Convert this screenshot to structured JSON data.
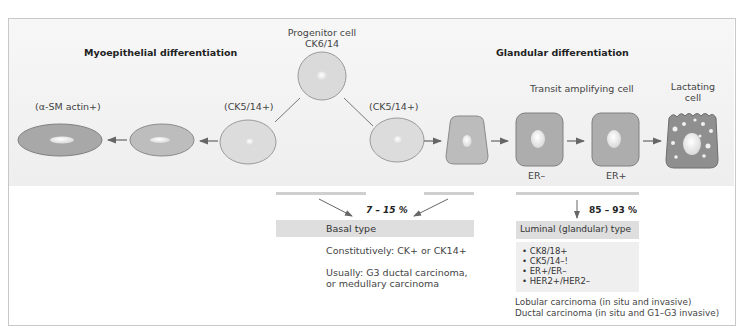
{
  "diagram": {
    "left_heading": "Myoepithelial differentiation",
    "right_heading": "Glandular differentiation",
    "progenitor": {
      "line1": "Progenitor cell",
      "line2": "CK6/14"
    },
    "left_cells": {
      "alpha_label": "(α-SM actin+)",
      "ck_label": "(CK5/14+)"
    },
    "right_cells": {
      "ck_label": "(CK5/14+)",
      "transit_label": "Transit amplifying cell",
      "er_minus": "ER–",
      "er_plus": "ER+",
      "lactating_line1": "Lactating",
      "lactating_line2": "cell"
    },
    "basal": {
      "percent": "7 – 15 %",
      "title": "Basal type",
      "line1": "Constitutively: CK+ or CK14+",
      "line2a": "Usually: G3 ductal carcinoma,",
      "line2b": "or medullary carcinoma"
    },
    "luminal": {
      "percent": "85 – 93 %",
      "title": "Luminal (glandular) type",
      "markers": [
        "• CK8/18+",
        "• CK5/14–!",
        "• ER+/ER–",
        "• HER2+/HER2–"
      ],
      "note1": "Lobular carcinoma (in situ and invasive)",
      "note2": "Ductal carcinoma (in situ and G1–G3 invasive)"
    },
    "colors": {
      "panel": "#eeeeee",
      "light_cell": "#dcdcdc",
      "mid_cell": "#b8b8b8",
      "dark_cell": "#a5a5a5",
      "lactating_cell": "#8f8f8f",
      "arrow": "#666666",
      "band": "#d8d8d8"
    }
  }
}
